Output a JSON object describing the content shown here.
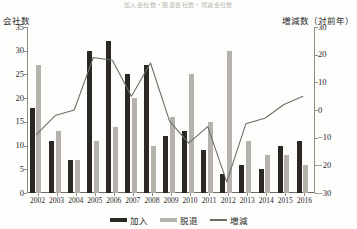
{
  "figure": {
    "top_strip_text": "加入会社数・脱退会社数・増減会社数",
    "left_axis_caption": "会社数",
    "right_axis_caption": "増減数（対前年）"
  },
  "legend": {
    "position": "bottom-center",
    "entries": [
      {
        "label": "加入",
        "marker": "bar",
        "color": "#2b2724"
      },
      {
        "label": "脱退",
        "marker": "bar",
        "color": "#b4b2ab"
      },
      {
        "label": "増減",
        "marker": "line",
        "color": "#6d6d68"
      }
    ]
  },
  "chart_data": {
    "type": "bar",
    "title": "加入会社数・脱退会社数・増減会社数",
    "xlabel": "",
    "ylabel": "会社数",
    "y2label": "増減数（対前年）",
    "grid": false,
    "categories": [
      "2002",
      "2003",
      "2004",
      "2005",
      "2006",
      "2007",
      "2008",
      "2009",
      "2010",
      "2011",
      "2012",
      "2013",
      "2014",
      "2015",
      "2016"
    ],
    "ylim": [
      0,
      35
    ],
    "yticks": [
      0,
      5,
      10,
      15,
      20,
      25,
      30,
      35
    ],
    "y2lim": [
      -30,
      30
    ],
    "y2ticks": [
      -30,
      -20,
      -10,
      0,
      10,
      20,
      30
    ],
    "series": [
      {
        "name": "加入",
        "axis": "left",
        "type": "bar",
        "color": "#2b2724",
        "values": [
          18,
          11,
          7,
          30,
          32,
          25,
          27,
          12,
          13,
          9,
          4,
          6,
          5,
          10,
          11
        ]
      },
      {
        "name": "脱退",
        "axis": "left",
        "type": "bar",
        "color": "#b4b2ab",
        "values": [
          27,
          13,
          7,
          11,
          14,
          20,
          10,
          16,
          25,
          15,
          30,
          11,
          8,
          8,
          6
        ]
      },
      {
        "name": "増減",
        "axis": "right",
        "type": "line",
        "color": "#6d6d68",
        "values": [
          -9,
          -2,
          0,
          19,
          18,
          5,
          17,
          -4,
          -12,
          -6,
          -26,
          -5,
          -3,
          2,
          5
        ]
      }
    ]
  }
}
